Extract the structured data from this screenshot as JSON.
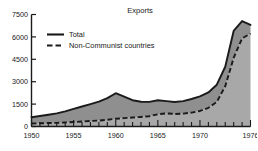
{
  "chart_data": {
    "type": "area",
    "title": "Exports",
    "xlabel": "",
    "ylabel": "",
    "xlim": [
      1950,
      1976
    ],
    "ylim": [
      0,
      7500
    ],
    "yticks": [
      0,
      1500,
      3000,
      4500,
      6000,
      7500
    ],
    "ytick_labels": [
      "0",
      "1500",
      "3000",
      "4500",
      "6000",
      "7500"
    ],
    "xticks": [
      1950,
      1955,
      1960,
      1965,
      1970,
      1976
    ],
    "xtick_labels": [
      "1950",
      "1955",
      "1960",
      "1965",
      "1970",
      "1976"
    ],
    "x_minor_tick_interval": 1,
    "grid": false,
    "legend_position": "upper-left",
    "fill_color": "#a8a8a8",
    "band_color": "#8f8f8f",
    "line_color": "#1a1a1a",
    "x": [
      1950,
      1951,
      1952,
      1953,
      1954,
      1955,
      1956,
      1957,
      1958,
      1959,
      1960,
      1961,
      1962,
      1963,
      1964,
      1965,
      1966,
      1967,
      1968,
      1969,
      1970,
      1971,
      1972,
      1973,
      1974,
      1975,
      1976
    ],
    "series": [
      {
        "name": "Total",
        "style": "solid",
        "values": [
          620,
          700,
          790,
          880,
          1010,
          1180,
          1340,
          1500,
          1660,
          1900,
          2230,
          2000,
          1760,
          1660,
          1650,
          1760,
          1700,
          1640,
          1700,
          1840,
          2020,
          2280,
          2800,
          4000,
          6400,
          7060,
          6800
        ]
      },
      {
        "name": "Non-Communist countries",
        "style": "dashed",
        "values": [
          200,
          215,
          230,
          245,
          270,
          300,
          330,
          370,
          400,
          450,
          520,
          560,
          600,
          640,
          690,
          820,
          880,
          840,
          860,
          930,
          1040,
          1250,
          1650,
          2700,
          4600,
          5900,
          6220
        ]
      }
    ]
  },
  "legend": {
    "items": [
      {
        "label": "Total",
        "style": "solid"
      },
      {
        "label": "Non-Communist countries",
        "style": "dashed"
      }
    ]
  }
}
